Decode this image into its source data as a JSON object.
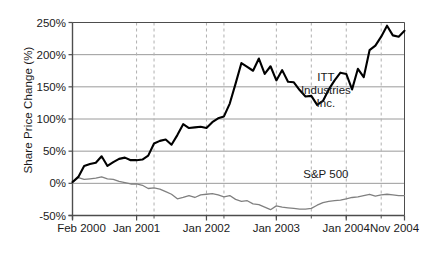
{
  "chart_data": {
    "type": "line",
    "title": "",
    "xlabel": "",
    "ylabel": "Share Price Change (%)",
    "ylim": [
      -50,
      250
    ],
    "yticks": [
      "-50%",
      "0%",
      "50%",
      "100%",
      "150%",
      "200%",
      "250%"
    ],
    "ytick_values": [
      -50,
      0,
      50,
      100,
      150,
      200,
      250
    ],
    "xticks": [
      "Feb 2000",
      "Jan 2001",
      "Jan 2002",
      "Jan 2003",
      "Jan 2004",
      "Nov 2004"
    ],
    "xtick_months": [
      0,
      11,
      23,
      35,
      47,
      57
    ],
    "xlim_months": [
      0,
      57
    ],
    "grid": "horizontal solid gray plus vertical dashed quarterly",
    "legend_position": "inline annotations at right",
    "colors": {
      "itt": "#000000",
      "sp500": "#808080",
      "gridline": "#9a9a9a",
      "dashed_gridline": "#b0b0b0",
      "axis": "#4d4d4d",
      "text": "#1a1a1a"
    },
    "annotations": [
      {
        "name": "itt-label",
        "lines": [
          "ITT",
          "Industries",
          "Inc."
        ],
        "month": 43.5,
        "value": 163
      },
      {
        "name": "sp500-label",
        "lines": [
          "S&P 500"
        ],
        "month": 43.5,
        "value": 13
      }
    ],
    "series": [
      {
        "name": "ITT Industries Inc.",
        "color": "#000000",
        "width": 2.1,
        "values": [
          2,
          10,
          27,
          30,
          32,
          42,
          27,
          33,
          38,
          40,
          36,
          36,
          37,
          43,
          62,
          66,
          68,
          60,
          75,
          92,
          86,
          87,
          88,
          86,
          95,
          101,
          104,
          124,
          155,
          187,
          181,
          175,
          194,
          170,
          182,
          160,
          176,
          158,
          157,
          145,
          135,
          136,
          122,
          128,
          146,
          160,
          172,
          170,
          146,
          178,
          165,
          207,
          214,
          228,
          245,
          230,
          228,
          237
        ]
      },
      {
        "name": "S&P 500",
        "color": "#808080",
        "width": 1.3,
        "values": [
          1,
          9,
          6,
          7,
          8,
          10,
          7,
          6,
          3,
          1,
          -1,
          -1,
          -3,
          -8,
          -7,
          -9,
          -13,
          -17,
          -24,
          -22,
          -19,
          -22,
          -18,
          -17,
          -16,
          -18,
          -21,
          -19,
          -25,
          -28,
          -27,
          -32,
          -33,
          -37,
          -41,
          -35,
          -37,
          -38,
          -39,
          -40,
          -40,
          -39,
          -34,
          -30,
          -28,
          -27,
          -26,
          -24,
          -22,
          -21,
          -19,
          -17,
          -20,
          -18,
          -17,
          -18,
          -19,
          -19
        ]
      }
    ]
  }
}
